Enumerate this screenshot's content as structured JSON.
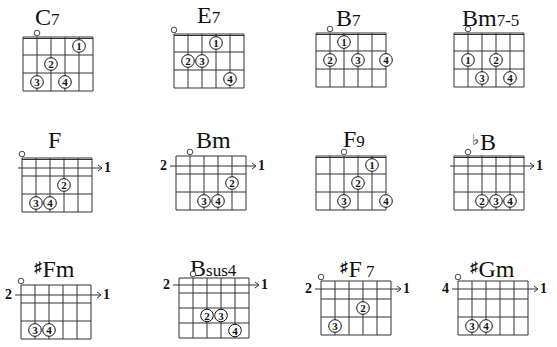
{
  "chords": [
    {
      "name": "C7",
      "root": "C",
      "accidental": "",
      "suffix": "7",
      "x": 23,
      "y": 37,
      "rows": 3,
      "cell_w": 14,
      "cell_h": 18,
      "title_x": 35,
      "title_y": 5,
      "open": 1,
      "nut": true,
      "fret_label": "",
      "barre_label": "",
      "dots": [
        {
          "s": 4,
          "f": 1,
          "n": "1"
        },
        {
          "s": 2,
          "f": 2,
          "n": "2"
        },
        {
          "s": 1,
          "f": 3,
          "n": "3"
        },
        {
          "s": 3,
          "f": 3,
          "n": "4"
        }
      ]
    },
    {
      "name": "E7",
      "root": "E",
      "accidental": "",
      "suffix": "7",
      "x": 174,
      "y": 34,
      "rows": 3,
      "cell_w": 14,
      "cell_h": 18,
      "title_x": 197,
      "title_y": 3,
      "open": 0,
      "nut": true,
      "fret_label": "",
      "barre_label": "",
      "dots": [
        {
          "s": 3,
          "f": 1,
          "n": "1"
        },
        {
          "s": 1,
          "f": 2,
          "n": "2"
        },
        {
          "s": 2,
          "f": 2,
          "n": "3"
        },
        {
          "s": 4,
          "f": 3,
          "n": "4"
        }
      ]
    },
    {
      "name": "B7",
      "root": "B",
      "accidental": "",
      "suffix": "7",
      "x": 316,
      "y": 33,
      "rows": 3,
      "cell_w": 14,
      "cell_h": 18,
      "title_x": 336,
      "title_y": 6,
      "open": 1,
      "nut": true,
      "fret_label": "",
      "barre_label": "",
      "dots": [
        {
          "s": 2,
          "f": 1,
          "n": "1"
        },
        {
          "s": 1,
          "f": 2,
          "n": "2"
        },
        {
          "s": 3,
          "f": 2,
          "n": "3"
        },
        {
          "s": 5,
          "f": 2,
          "n": "4"
        }
      ]
    },
    {
      "name": "Bm7-5",
      "root": "Bm",
      "accidental": "",
      "suffix": "7-5",
      "x": 454,
      "y": 33,
      "rows": 3,
      "cell_w": 14,
      "cell_h": 18,
      "title_x": 462,
      "title_y": 6,
      "open": 1,
      "nut": true,
      "fret_label": "",
      "barre_label": "",
      "dots": [
        {
          "s": 1,
          "f": 2,
          "n": "1"
        },
        {
          "s": 3,
          "f": 2,
          "n": "2"
        },
        {
          "s": 2,
          "f": 3,
          "n": "3"
        },
        {
          "s": 4,
          "f": 3,
          "n": "4"
        }
      ]
    },
    {
      "name": "F",
      "root": "F",
      "accidental": "",
      "suffix": "",
      "x": 22,
      "y": 158,
      "rows": 3,
      "cell_w": 14,
      "cell_h": 18,
      "title_x": 48,
      "title_y": 128,
      "open": 0,
      "nut": true,
      "fret_label": "",
      "barre_label": "1",
      "barre_y": 10,
      "dots": [
        {
          "s": 3,
          "f": 2,
          "n": "2"
        },
        {
          "s": 1,
          "f": 3,
          "n": "3"
        },
        {
          "s": 2,
          "f": 3,
          "n": "4"
        }
      ]
    },
    {
      "name": "Bm",
      "root": "Bm",
      "accidental": "",
      "suffix": "",
      "x": 176,
      "y": 156,
      "rows": 3,
      "cell_w": 14,
      "cell_h": 18,
      "title_x": 196,
      "title_y": 128,
      "open": 1,
      "nut": false,
      "fret_label": "2",
      "barre_label": "1",
      "barre_y": 10,
      "dots": [
        {
          "s": 4,
          "f": 2,
          "n": "2"
        },
        {
          "s": 2,
          "f": 3,
          "n": "3"
        },
        {
          "s": 3,
          "f": 3,
          "n": "4"
        }
      ]
    },
    {
      "name": "F9",
      "root": "F",
      "accidental": "",
      "suffix": "9",
      "x": 316,
      "y": 156,
      "rows": 3,
      "cell_w": 14,
      "cell_h": 18,
      "title_x": 343,
      "title_y": 127,
      "open": 2,
      "nut": true,
      "fret_label": "",
      "barre_label": "",
      "dots": [
        {
          "s": 4,
          "f": 1,
          "n": "1"
        },
        {
          "s": 3,
          "f": 2,
          "n": "2"
        },
        {
          "s": 2,
          "f": 3,
          "n": "3"
        },
        {
          "s": 5,
          "f": 3,
          "n": "4"
        }
      ]
    },
    {
      "name": "bB",
      "root": "B",
      "accidental": "♭",
      "suffix": "",
      "x": 454,
      "y": 156,
      "rows": 3,
      "cell_w": 14,
      "cell_h": 18,
      "title_x": 472,
      "title_y": 130,
      "open": 1,
      "nut": true,
      "fret_label": "",
      "barre_label": "1",
      "barre_y": 10,
      "dots": [
        {
          "s": 2,
          "f": 3,
          "n": "2"
        },
        {
          "s": 3,
          "f": 3,
          "n": "3"
        },
        {
          "s": 4,
          "f": 3,
          "n": "4"
        }
      ]
    },
    {
      "name": "#Fm",
      "root": "Fm",
      "accidental": "♯",
      "suffix": "",
      "x": 21,
      "y": 285,
      "rows": 3,
      "cell_w": 14,
      "cell_h": 18,
      "title_x": 34,
      "title_y": 257,
      "open": 0,
      "nut": false,
      "fret_label": "2",
      "barre_label": "1",
      "barre_y": 10,
      "dots": [
        {
          "s": 1,
          "f": 3,
          "n": "3"
        },
        {
          "s": 2,
          "f": 3,
          "n": "4"
        }
      ]
    },
    {
      "name": "Bsus4",
      "root": "B",
      "accidental": "",
      "suffix": "sus4",
      "x": 179,
      "y": 278,
      "rows": 4,
      "cell_w": 14,
      "cell_h": 15,
      "title_x": 190,
      "title_y": 256,
      "open": 1,
      "nut": false,
      "fret_label": "2",
      "barre_label": "1",
      "barre_y": 7,
      "dots": [
        {
          "s": 2,
          "f": 3,
          "n": "2"
        },
        {
          "s": 3,
          "f": 3,
          "n": "3"
        },
        {
          "s": 4,
          "f": 4,
          "n": "4"
        }
      ]
    },
    {
      "name": "#F7",
      "root": "F",
      "accidental": "♯",
      "suffix": " 7",
      "x": 321,
      "y": 281,
      "rows": 3,
      "cell_w": 14,
      "cell_h": 18,
      "title_x": 340,
      "title_y": 257,
      "open": 0,
      "nut": false,
      "fret_label": "2",
      "barre_label": "1",
      "barre_y": 8,
      "dots": [
        {
          "s": 3,
          "f": 2,
          "n": "2"
        },
        {
          "s": 1,
          "f": 3,
          "n": "3"
        }
      ]
    },
    {
      "name": "#Gm",
      "root": "Gm",
      "accidental": "♯",
      "suffix": "",
      "x": 458,
      "y": 281,
      "rows": 3,
      "cell_w": 14,
      "cell_h": 18,
      "title_x": 470,
      "title_y": 257,
      "open": 0,
      "nut": false,
      "fret_label": "4",
      "barre_label": "1",
      "barre_y": 8,
      "dots": [
        {
          "s": 1,
          "f": 3,
          "n": "3"
        },
        {
          "s": 2,
          "f": 3,
          "n": "4"
        }
      ]
    }
  ],
  "colors": {
    "ink": "#111111",
    "grid": "#333333",
    "background": "#ffffff"
  }
}
